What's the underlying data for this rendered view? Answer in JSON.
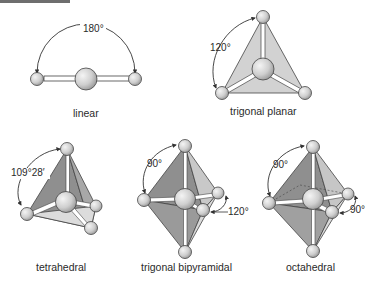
{
  "figure": {
    "geometries": [
      {
        "name": "linear",
        "label": "linear",
        "angles": [
          "180°"
        ]
      },
      {
        "name": "trigonal-planar",
        "label": "trigonal planar",
        "angles": [
          "120°"
        ]
      },
      {
        "name": "tetrahedral",
        "label": "tetrahedral",
        "angles": [
          "109°28′"
        ]
      },
      {
        "name": "trigonal-bipyramidal",
        "label": "trigonal bipyramidal",
        "angles": [
          "90°",
          "120°"
        ]
      },
      {
        "name": "octahedral",
        "label": "octahedral",
        "angles": [
          "90°",
          "90°"
        ]
      }
    ],
    "colors": {
      "face_light": "#d9d9d9",
      "face_dark": "#8f8f8f",
      "face_mid": "#b5b5b5",
      "atom": "#cfcfcf",
      "line": "#333333"
    }
  }
}
